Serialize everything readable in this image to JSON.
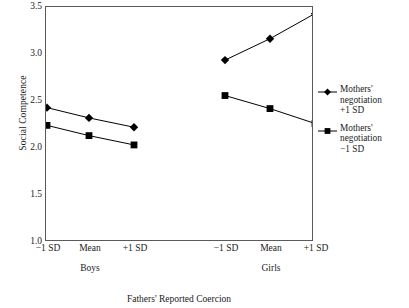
{
  "chart_data": {
    "type": "line",
    "title": "",
    "xlabel": "Fathers' Reported Coercion",
    "ylabel": "Social Competence",
    "ylim": [
      1.0,
      3.5
    ],
    "yticks": [
      "3.5",
      "3.0",
      "2.5",
      "2.0",
      "1.5",
      "1.0"
    ],
    "ytick_values": [
      3.5,
      3.0,
      2.5,
      2.0,
      1.5,
      1.0
    ],
    "grid": false,
    "legend_position": "right",
    "panels": [
      {
        "name": "Boys",
        "categories": [
          "−1 SD",
          "Mean",
          "+1 SD"
        ]
      },
      {
        "name": "Girls",
        "categories": [
          "−1 SD",
          "Mean",
          "+1 SD"
        ]
      }
    ],
    "categories": [
      "−1 SD",
      "Mean",
      "+1 SD",
      "−1 SD",
      "Mean",
      "+1 SD"
    ],
    "series": [
      {
        "name": "Mothers' negotiation +1 SD",
        "marker": "diamond",
        "color": "#000000",
        "values": [
          2.42,
          2.31,
          2.21,
          2.93,
          3.16,
          3.43
        ]
      },
      {
        "name": "Mothers' negotiation −1 SD",
        "marker": "square",
        "color": "#000000",
        "values": [
          2.23,
          2.12,
          2.02,
          2.55,
          2.41,
          2.25
        ]
      }
    ]
  },
  "axes": {
    "y_title": "Social Competence",
    "x_title": "Fathers' Reported Coercion",
    "y_tick_labels": [
      "3.5",
      "3.0",
      "2.5",
      "2.0",
      "1.5",
      "1.0"
    ],
    "x_tick_labels": [
      "−1 SD",
      "Mean",
      "+1 SD",
      "−1 SD",
      "Mean",
      "+1 SD"
    ],
    "group_labels": [
      "Boys",
      "Girls"
    ]
  },
  "legend": {
    "entries": [
      {
        "marker": "diamond",
        "line1": "Mothers'",
        "line2": "negotiation",
        "line3": "+1 SD"
      },
      {
        "marker": "square",
        "line1": "Mothers'",
        "line2": "negotiation",
        "line3": "−1 SD"
      }
    ]
  },
  "style": {
    "frame_color": "#5a5a5a",
    "series_color": "#000000",
    "background": "#ffffff"
  }
}
